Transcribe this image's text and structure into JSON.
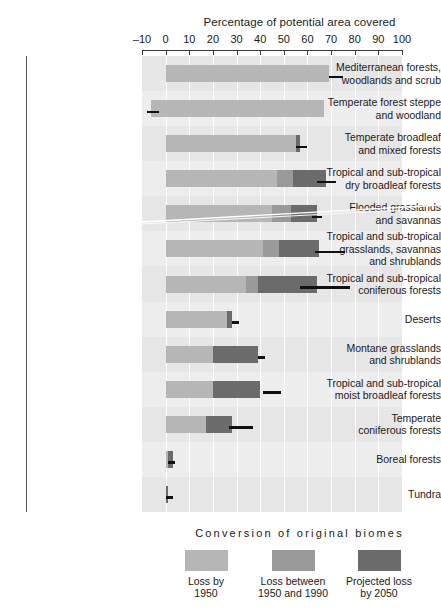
{
  "chart_data": {
    "type": "bar",
    "orientation": "horizontal",
    "stacked": true,
    "title": "Percentage of potential area covered",
    "xlabel": "Percentage of potential area covered",
    "ylabel": "",
    "xlim": [
      -10,
      100
    ],
    "xticks": [
      -10,
      0,
      10,
      20,
      30,
      40,
      50,
      60,
      70,
      80,
      90,
      100
    ],
    "xticklabels": [
      "–10",
      "0",
      "10",
      "20",
      "30",
      "40",
      "50",
      "60",
      "70",
      "80",
      "90",
      "100"
    ],
    "grid": true,
    "legend_title": "Conversion of original biomes",
    "legend_position": "bottom",
    "series": [
      {
        "name": "Loss by 1950",
        "key": "loss1950",
        "color": "#b6b6b6"
      },
      {
        "name": "Loss between 1950 and 1990",
        "key": "loss1990",
        "color": "#9a9a9a"
      },
      {
        "name": "Projected loss by 2050",
        "key": "loss2050",
        "color": "#6b6b6b"
      }
    ],
    "categories": [
      "Mediterranean forests, woodlands and scrub",
      "Temperate forest steppe and woodland",
      "Temperate broadleaf and mixed forests",
      "Tropical and sub-tropical dry broadleaf forests",
      "Flooded grasslands and savannas",
      "Tropical and sub-tropical grasslands, savannas and shrublands",
      "Tropical and sub-tropical coniferous forests",
      "Deserts",
      "Montane grasslands and shrublands",
      "Tropical and sub-tropical moist broadleaf forests",
      "Temperate coniferous forests",
      "Boreal forests",
      "Tundra"
    ],
    "category_lines": [
      [
        "Mediterranean forests,",
        "woodlands and scrub"
      ],
      [
        "Temperate forest steppe",
        "and woodland"
      ],
      [
        "Temperate broadleaf",
        "and mixed forests"
      ],
      [
        "Tropical and sub-tropical",
        "dry broadleaf forests"
      ],
      [
        "Flooded grasslands",
        "and savannas"
      ],
      [
        "Tropical and sub-tropical",
        "grasslands, savannas",
        "and shrublands"
      ],
      [
        "Tropical and sub-tropical",
        "coniferous forests"
      ],
      [
        "Deserts"
      ],
      [
        "Montane grasslands",
        "and shrublands"
      ],
      [
        "Tropical and sub-tropical",
        "moist broadleaf forests"
      ],
      [
        "Temperate",
        "coniferous forests"
      ],
      [
        "Boreal forests"
      ],
      [
        "Tundra"
      ]
    ],
    "data": [
      {
        "category": "Mediterranean forests, woodlands and scrub",
        "start": 0,
        "loss1950": 69,
        "loss1990": 0,
        "loss2050": 0,
        "total": 69,
        "error_from": 69,
        "error_to": 75
      },
      {
        "category": "Temperate forest steppe and woodland",
        "start": -6,
        "loss1950": 73,
        "loss1990": 0,
        "loss2050": 0,
        "total": 67,
        "error_from": -8,
        "error_to": -3
      },
      {
        "category": "Temperate broadleaf and mixed forests",
        "start": 0,
        "loss1950": 55,
        "loss1990": 0,
        "loss2050": 2,
        "total": 57,
        "error_from": 55,
        "error_to": 60
      },
      {
        "category": "Tropical and sub-tropical dry broadleaf forests",
        "start": 0,
        "loss1950": 47,
        "loss1990": 7,
        "loss2050": 14,
        "total": 68,
        "error_from": 64,
        "error_to": 72
      },
      {
        "category": "Flooded grasslands and savannas",
        "start": 0,
        "loss1950": 45,
        "loss1990": 8,
        "loss2050": 11,
        "total": 64,
        "error_from": 62,
        "error_to": 66
      },
      {
        "category": "Tropical and sub-tropical grasslands, savannas and shrublands",
        "start": 0,
        "loss1950": 41,
        "loss1990": 7,
        "loss2050": 17,
        "total": 65,
        "error_from": 63,
        "error_to": 76
      },
      {
        "category": "Tropical and sub-tropical coniferous forests",
        "start": 0,
        "loss1950": 34,
        "loss1990": 5,
        "loss2050": 25,
        "total": 64,
        "error_from": 57,
        "error_to": 78
      },
      {
        "category": "Deserts",
        "start": 0,
        "loss1950": 26,
        "loss1990": 0,
        "loss2050": 2,
        "total": 28,
        "error_from": 28,
        "error_to": 31
      },
      {
        "category": "Montane grasslands and shrublands",
        "start": 0,
        "loss1950": 20,
        "loss1990": 0,
        "loss2050": 19,
        "total": 39,
        "error_from": 39,
        "error_to": 42
      },
      {
        "category": "Tropical and sub-tropical moist broadleaf forests",
        "start": 0,
        "loss1950": 20,
        "loss1990": 0,
        "loss2050": 20,
        "total": 40,
        "error_from": 41,
        "error_to": 49
      },
      {
        "category": "Temperate coniferous forests",
        "start": 0,
        "loss1950": 17,
        "loss1990": 0,
        "loss2050": 11,
        "total": 28,
        "error_from": 27,
        "error_to": 37
      },
      {
        "category": "Boreal forests",
        "start": 0,
        "loss1950": 1,
        "loss1990": 0,
        "loss2050": 2,
        "total": 3,
        "error_from": 1,
        "error_to": 4
      },
      {
        "category": "Tundra",
        "start": 0,
        "loss1950": 0,
        "loss1990": 0,
        "loss2050": 1,
        "total": 1,
        "error_from": 0,
        "error_to": 3
      }
    ]
  },
  "legend": {
    "title": "Conversion of original biomes",
    "items": [
      {
        "label_lines": [
          "Loss by",
          "1950"
        ],
        "color": "#b6b6b6"
      },
      {
        "label_lines": [
          "Loss between",
          "1950 and 1990"
        ],
        "color": "#9a9a9a"
      },
      {
        "label_lines": [
          "Projected loss",
          "by 2050"
        ],
        "color": "#6b6b6b"
      }
    ]
  }
}
